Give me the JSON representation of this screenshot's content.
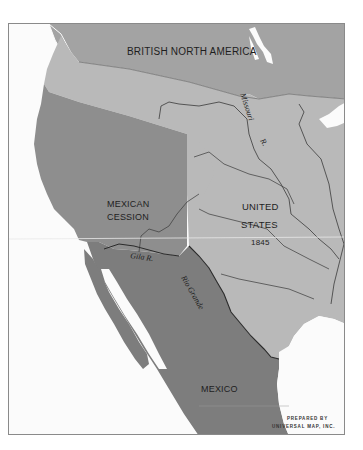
{
  "map": {
    "colors": {
      "water": "#fbfbfb",
      "british_north_america": "#a3a3a3",
      "united_states": "#b9b9b9",
      "mexican_cession": "#8e8e8e",
      "mexico": "#7d7d7d",
      "rivers": "#3a3a3a",
      "frame": "#8a8a8a"
    },
    "regions": [
      {
        "id": "british-north-america",
        "label": "BRITISH NORTH AMERICA"
      },
      {
        "id": "mexican-cession",
        "label_line1": "MEXICAN",
        "label_line2": "CESSION"
      },
      {
        "id": "united-states",
        "label_line1": "UNITED",
        "label_line2": "STATES",
        "year": "1845"
      },
      {
        "id": "mexico",
        "label": "MEXICO"
      }
    ],
    "rivers": [
      {
        "id": "missouri",
        "label": "Missouri",
        "label2": "R."
      },
      {
        "id": "gila",
        "label": "Gila R."
      },
      {
        "id": "rio-grande",
        "label": "Rio Grande"
      }
    ],
    "credit": {
      "line1": "PREPARED BY",
      "line2": "UNIVERSAL MAP, INC."
    }
  }
}
